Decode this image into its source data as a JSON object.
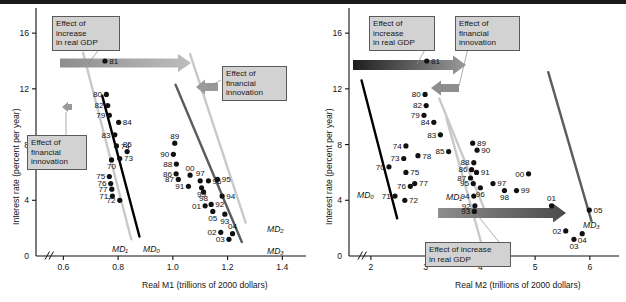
{
  "figure": {
    "panels": [
      "left",
      "right"
    ]
  },
  "chart_data": [
    {
      "type": "scatter",
      "panel": "left",
      "title": "Real M1 money demand",
      "xlabel": "Real M1 (trillions of 2000 dollars)",
      "ylabel": "Interest rate (percent per year)",
      "xlim": [
        0.5,
        1.45
      ],
      "ylim": [
        0,
        16.8
      ],
      "xticks": [
        "0.6",
        "0.8",
        "1.0",
        "1.2",
        "1.4"
      ],
      "xtick_values": [
        0.6,
        0.8,
        1.0,
        1.2,
        1.4
      ],
      "yticks": [
        "0",
        "4",
        "8",
        "12",
        "16"
      ],
      "ytick_values": [
        0,
        4,
        8,
        12,
        16
      ],
      "axis_break": true,
      "grid": false,
      "legend": "none",
      "points": [
        {
          "label": "81",
          "x": 0.752,
          "y": 14.0,
          "lp": "right"
        },
        {
          "label": "80",
          "x": 0.757,
          "y": 11.6,
          "lp": "left"
        },
        {
          "label": "82",
          "x": 0.762,
          "y": 10.8,
          "lp": "left"
        },
        {
          "label": "79",
          "x": 0.768,
          "y": 10.1,
          "lp": "left"
        },
        {
          "label": "84",
          "x": 0.802,
          "y": 9.6,
          "lp": "right"
        },
        {
          "label": "83",
          "x": 0.788,
          "y": 8.7,
          "lp": "left"
        },
        {
          "label": "74",
          "x": 0.794,
          "y": 7.9,
          "lp": "right"
        },
        {
          "label": "85",
          "x": 0.833,
          "y": 7.5,
          "lp": "above"
        },
        {
          "label": "73",
          "x": 0.806,
          "y": 7.0,
          "lp": "right"
        },
        {
          "label": "70",
          "x": 0.776,
          "y": 6.9,
          "lp": "below"
        },
        {
          "label": "75",
          "x": 0.768,
          "y": 5.7,
          "lp": "left"
        },
        {
          "label": "76",
          "x": 0.773,
          "y": 5.2,
          "lp": "left"
        },
        {
          "label": "77",
          "x": 0.777,
          "y": 4.8,
          "lp": "left"
        },
        {
          "label": "71",
          "x": 0.779,
          "y": 4.3,
          "lp": "left"
        },
        {
          "label": "72",
          "x": 0.806,
          "y": 4.0,
          "lp": "left"
        },
        {
          "label": "89",
          "x": 1.007,
          "y": 8.1,
          "lp": "above"
        },
        {
          "label": "90",
          "x": 1.002,
          "y": 7.3,
          "lp": "left"
        },
        {
          "label": "88",
          "x": 1.013,
          "y": 6.6,
          "lp": "left"
        },
        {
          "label": "86",
          "x": 1.012,
          "y": 5.9,
          "lp": "left"
        },
        {
          "label": "87",
          "x": 1.02,
          "y": 5.5,
          "lp": "left"
        },
        {
          "label": "00",
          "x": 1.063,
          "y": 5.8,
          "lp": "above"
        },
        {
          "label": "97",
          "x": 1.1,
          "y": 5.4,
          "lp": "above"
        },
        {
          "label": "96",
          "x": 1.13,
          "y": 5.4,
          "lp": "right"
        },
        {
          "label": "95",
          "x": 1.163,
          "y": 5.5,
          "lp": "right"
        },
        {
          "label": "91",
          "x": 1.057,
          "y": 5.0,
          "lp": "left"
        },
        {
          "label": "99",
          "x": 1.105,
          "y": 4.9,
          "lp": "below"
        },
        {
          "label": "98",
          "x": 1.112,
          "y": 4.6,
          "lp": "below"
        },
        {
          "label": "94",
          "x": 1.18,
          "y": 4.3,
          "lp": "right"
        },
        {
          "label": "92",
          "x": 1.14,
          "y": 3.7,
          "lp": "right"
        },
        {
          "label": "01",
          "x": 1.118,
          "y": 3.6,
          "lp": "left"
        },
        {
          "label": "05",
          "x": 1.146,
          "y": 3.2,
          "lp": "below"
        },
        {
          "label": "93",
          "x": 1.19,
          "y": 3.0,
          "lp": "below"
        },
        {
          "label": "02",
          "x": 1.175,
          "y": 1.7,
          "lp": "left"
        },
        {
          "label": "04",
          "x": 1.218,
          "y": 1.6,
          "lp": "above"
        },
        {
          "label": "03",
          "x": 1.205,
          "y": 1.2,
          "lp": "left"
        }
      ],
      "curves": [
        {
          "name": "MD0",
          "label": "MD₀",
          "color": "#000000",
          "x1": 0.742,
          "y1": 11.5,
          "x2": 0.878,
          "y2": 1.4
        },
        {
          "name": "MD1",
          "label": "MD₁",
          "color": "#c9c9c9",
          "x1": 0.672,
          "y1": 14.6,
          "x2": 0.848,
          "y2": 1.2
        },
        {
          "name": "MD2",
          "label": "MD₂",
          "color": "#c9c9c9",
          "x1": 1.063,
          "y1": 14.5,
          "x2": 1.266,
          "y2": 2.4
        },
        {
          "name": "MD3",
          "label": "MD₃",
          "color": "#5c5c5c",
          "x1": 1.01,
          "y1": 12.3,
          "x2": 1.252,
          "y2": 1.0
        }
      ],
      "annotations": [
        {
          "id": "gdp-left",
          "text": "Effect of\nincrease\nin real GDP",
          "kind": "box"
        },
        {
          "id": "fin-left",
          "text": "Effect of\nfinancial\ninnovation",
          "kind": "box"
        },
        {
          "id": "fin-right",
          "text": "Effect of\nfinancial\ninnovation",
          "kind": "box"
        }
      ],
      "arrows": [
        {
          "id": "gdp-arrow",
          "direction": "right",
          "color_from": "#8e8e8e",
          "color_to": "#bdbdbd"
        },
        {
          "id": "fin-arrow-right",
          "direction": "left",
          "color": "#9a9a9a"
        },
        {
          "id": "fin-arrow-left",
          "direction": "left",
          "color": "#9a9a9a"
        }
      ]
    },
    {
      "type": "scatter",
      "panel": "right",
      "title": "Real M2 money demand",
      "xlabel": "Real M2 (trillions of 2000 dollars)",
      "ylabel": "Interest rate (percent per year)",
      "xlim": [
        1.6,
        6.35
      ],
      "ylim": [
        0,
        16.8
      ],
      "xticks": [
        "2",
        "3",
        "4",
        "5",
        "6"
      ],
      "xtick_values": [
        2,
        3,
        4,
        5,
        6
      ],
      "yticks": [
        "0",
        "4",
        "8",
        "12",
        "16"
      ],
      "ytick_values": [
        0,
        4,
        8,
        12,
        16
      ],
      "axis_break": true,
      "grid": false,
      "legend": "none",
      "points": [
        {
          "label": "81",
          "x": 3.02,
          "y": 14.0,
          "lp": "right"
        },
        {
          "label": "80",
          "x": 2.99,
          "y": 11.6,
          "lp": "left"
        },
        {
          "label": "82",
          "x": 3.01,
          "y": 10.8,
          "lp": "left"
        },
        {
          "label": "79",
          "x": 2.97,
          "y": 10.1,
          "lp": "left"
        },
        {
          "label": "84",
          "x": 3.15,
          "y": 9.6,
          "lp": "left"
        },
        {
          "label": "83",
          "x": 3.27,
          "y": 8.7,
          "lp": "left"
        },
        {
          "label": "89",
          "x": 3.86,
          "y": 8.1,
          "lp": "right"
        },
        {
          "label": "74",
          "x": 2.64,
          "y": 7.9,
          "lp": "left"
        },
        {
          "label": "90",
          "x": 3.94,
          "y": 7.6,
          "lp": "right"
        },
        {
          "label": "78",
          "x": 2.86,
          "y": 7.2,
          "lp": "right"
        },
        {
          "label": "85",
          "x": 3.42,
          "y": 7.5,
          "lp": "left"
        },
        {
          "label": "73",
          "x": 2.6,
          "y": 7.0,
          "lp": "left"
        },
        {
          "label": "88",
          "x": 3.88,
          "y": 6.7,
          "lp": "left"
        },
        {
          "label": "86",
          "x": 3.84,
          "y": 6.2,
          "lp": "left"
        },
        {
          "label": "70",
          "x": 2.33,
          "y": 6.4,
          "lp": "left"
        },
        {
          "label": "75",
          "x": 2.64,
          "y": 6.0,
          "lp": "right"
        },
        {
          "label": "91",
          "x": 3.93,
          "y": 6.0,
          "lp": "right"
        },
        {
          "label": "00",
          "x": 4.88,
          "y": 5.9,
          "lp": "left"
        },
        {
          "label": "87",
          "x": 3.82,
          "y": 5.6,
          "lp": "left"
        },
        {
          "label": "77",
          "x": 2.8,
          "y": 5.2,
          "lp": "right"
        },
        {
          "label": "76",
          "x": 2.72,
          "y": 5.0,
          "lp": "left"
        },
        {
          "label": "95",
          "x": 3.87,
          "y": 5.2,
          "lp": "left"
        },
        {
          "label": "97",
          "x": 4.23,
          "y": 5.2,
          "lp": "right"
        },
        {
          "label": "96",
          "x": 4.0,
          "y": 4.9,
          "lp": "below"
        },
        {
          "label": "98",
          "x": 4.44,
          "y": 4.7,
          "lp": "below"
        },
        {
          "label": "99",
          "x": 4.66,
          "y": 4.7,
          "lp": "right"
        },
        {
          "label": "94",
          "x": 3.88,
          "y": 4.3,
          "lp": "left"
        },
        {
          "label": "71",
          "x": 2.44,
          "y": 4.3,
          "lp": "left"
        },
        {
          "label": "72",
          "x": 2.62,
          "y": 4.0,
          "lp": "right"
        },
        {
          "label": "92",
          "x": 3.9,
          "y": 3.6,
          "lp": "left"
        },
        {
          "label": "01",
          "x": 5.3,
          "y": 3.6,
          "lp": "above"
        },
        {
          "label": "93",
          "x": 3.89,
          "y": 3.2,
          "lp": "left"
        },
        {
          "label": "05",
          "x": 5.99,
          "y": 3.3,
          "lp": "right"
        },
        {
          "label": "02",
          "x": 5.56,
          "y": 1.8,
          "lp": "left"
        },
        {
          "label": "04",
          "x": 5.86,
          "y": 1.6,
          "lp": "below"
        },
        {
          "label": "03",
          "x": 5.71,
          "y": 1.2,
          "lp": "below"
        }
      ],
      "curves": [
        {
          "name": "MD0",
          "label": "MD₀",
          "color": "#000000",
          "x1": 1.83,
          "y1": 12.6,
          "x2": 2.48,
          "y2": 2.7
        },
        {
          "name": "MD1",
          "label": "MD₁",
          "color": "#c9c9c9",
          "x1": 3.25,
          "y1": 11.3,
          "x2": 4.1,
          "y2": 3.1
        },
        {
          "name": "MD2",
          "label": "MD₂",
          "color": "#c9c9c9",
          "x1": 3.38,
          "y1": 9.9,
          "x2": 4.02,
          "y2": 0.9
        },
        {
          "name": "MD3",
          "label": "MD₃",
          "color": "#5c5c5c",
          "x1": 5.24,
          "y1": 13.2,
          "x2": 6.03,
          "y2": 2.5
        }
      ],
      "annotations": [
        {
          "id": "gdp-top",
          "text": "Effect of\nincrease\nin real GDP",
          "kind": "box"
        },
        {
          "id": "fin-top",
          "text": "Effect of\nfinancial\ninnovation",
          "kind": "box"
        },
        {
          "id": "gdp-bottom",
          "text": "Effect of increase\nin real GDP",
          "kind": "box"
        }
      ],
      "arrows": [
        {
          "id": "gdp-arrow-top",
          "direction": "right",
          "color_from": "#1e1e1e",
          "color_to": "#9a9a9a"
        },
        {
          "id": "fin-arrow",
          "direction": "left",
          "color": "#8e8e8e"
        },
        {
          "id": "gdp-arrow-bottom",
          "direction": "right",
          "color_from": "#8e8e8e",
          "color_to": "#4a4a4a"
        }
      ]
    }
  ]
}
